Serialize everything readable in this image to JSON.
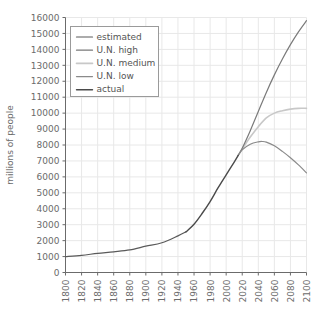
{
  "chart_data": {
    "type": "line",
    "title": "",
    "subtitle": "",
    "xlabel": "",
    "ylabel": "millions of people",
    "xlim": [
      1800,
      2100
    ],
    "ylim": [
      0,
      16000
    ],
    "grid": true,
    "legend_position": "upper-left",
    "xticks": [
      1800,
      1820,
      1840,
      1860,
      1880,
      1900,
      1920,
      1940,
      1960,
      1980,
      2000,
      2020,
      2040,
      2060,
      2080,
      2100
    ],
    "xtick_labels": [
      "1800",
      "1820",
      "1840",
      "1860",
      "1880",
      "1900",
      "1920",
      "1940",
      "1960",
      "1980",
      "2000",
      "2020",
      "2040",
      "2060",
      "2080",
      "2100"
    ],
    "yticks": [
      0,
      1000,
      2000,
      3000,
      4000,
      5000,
      6000,
      7000,
      8000,
      9000,
      10000,
      11000,
      12000,
      13000,
      14000,
      15000,
      16000
    ],
    "ytick_labels": [
      "0",
      "1000",
      "2000",
      "3000",
      "4000",
      "5000",
      "6000",
      "7000",
      "8000",
      "9000",
      "10000",
      "11000",
      "12000",
      "13000",
      "14000",
      "15000",
      "16000"
    ],
    "series": [
      {
        "name": "estimated",
        "color": "#5a5a5a",
        "width": 1.2,
        "x": [
          1800,
          1820,
          1840,
          1860,
          1880,
          1900,
          1920,
          1940,
          1950
        ],
        "values": [
          1000,
          1080,
          1200,
          1300,
          1420,
          1650,
          1870,
          2300,
          2550
        ]
      },
      {
        "name": "U.N. high",
        "color": "#7a7a7a",
        "width": 1.2,
        "x": [
          2015,
          2020,
          2030,
          2040,
          2050,
          2060,
          2070,
          2080,
          2090,
          2100
        ],
        "values": [
          7350,
          7800,
          8900,
          10100,
          11300,
          12400,
          13400,
          14300,
          15100,
          15800
        ]
      },
      {
        "name": "U.N. medium",
        "color": "#c8c8c8",
        "width": 1.6,
        "x": [
          2015,
          2020,
          2030,
          2040,
          2050,
          2060,
          2070,
          2080,
          2090,
          2100
        ],
        "values": [
          7350,
          7750,
          8500,
          9150,
          9700,
          10000,
          10150,
          10250,
          10300,
          10300
        ]
      },
      {
        "name": "U.N. low",
        "color": "#8a8a8a",
        "width": 1.2,
        "x": [
          2015,
          2020,
          2030,
          2040,
          2045,
          2050,
          2060,
          2070,
          2080,
          2090,
          2100
        ],
        "values": [
          7350,
          7700,
          8050,
          8200,
          8220,
          8180,
          7950,
          7600,
          7200,
          6750,
          6250
        ]
      },
      {
        "name": "actual",
        "color": "#4a4a4a",
        "width": 1.4,
        "x": [
          1950,
          1960,
          1970,
          1980,
          1990,
          2000,
          2010,
          2015
        ],
        "values": [
          2550,
          3030,
          3700,
          4450,
          5320,
          6130,
          6930,
          7350
        ]
      }
    ]
  },
  "legend": {
    "items": [
      {
        "label": "estimated"
      },
      {
        "label": "U.N. high"
      },
      {
        "label": "U.N. medium"
      },
      {
        "label": "U.N. low"
      },
      {
        "label": "actual"
      }
    ]
  },
  "style": {
    "grid_color": "#e8e8e8",
    "axis_color": "#6b6b6b",
    "legend_border": "#9a9a9a",
    "background": "#ffffff"
  }
}
